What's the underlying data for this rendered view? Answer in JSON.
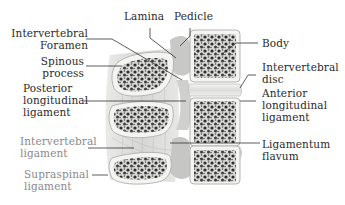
{
  "figure": {
    "labels": {
      "lamina": "Lamina",
      "pedicle": "Pedicle",
      "intervertebral_foramen": [
        "Intervertebral",
        "Foramen"
      ],
      "spinous_process": [
        "Spinous",
        "process"
      ],
      "posterior_longitudinal_ligament": [
        "Posterior",
        "longitudinal",
        "ligament"
      ],
      "intervertebral_ligament": [
        "Intervertebral",
        "ligament"
      ],
      "supraspinal_ligament": [
        "Supraspinal",
        "ligament"
      ],
      "body": "Body",
      "intervertebral_disc": [
        "Intervertebral",
        "disc"
      ],
      "anterior_longitudinal_ligament": [
        "Anterior",
        "longitudinal",
        "ligament"
      ],
      "ligamentum_flavum": [
        "Ligamentum",
        "flavum"
      ]
    },
    "colors": {
      "label_text": "#2a2a2a",
      "label_text_light": "#8a8a8a",
      "leader_line": "#333333",
      "bone_cortex": "#f4f4f2",
      "bone_trabecular": "#3a3a3a",
      "disc": "#e8e8e6",
      "ligament": "#d8d8d6"
    }
  }
}
